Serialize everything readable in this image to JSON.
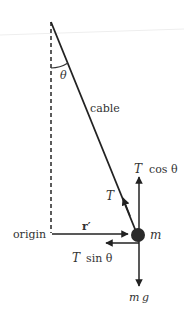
{
  "diagram": {
    "colors": {
      "line": "#222222",
      "text": "#333333",
      "mass": "#2a2a2a",
      "background": "#ffffff"
    },
    "labels": {
      "theta": "θ",
      "cable": "cable",
      "tension_vec": "T",
      "t_cos": "T",
      "cos_theta": "cos θ",
      "t_sin": "T",
      "sin_theta": "sin θ",
      "origin": "origin",
      "r_prime": "r′",
      "mass": "m",
      "weight_m": "m",
      "weight_g": "g"
    },
    "elements": [
      {
        "id": "pivot",
        "x": 51,
        "y": 22
      },
      {
        "id": "mass",
        "x": 137,
        "y": 234,
        "radius": 7
      },
      {
        "id": "vertical-reference",
        "style": "dashed",
        "from": [
          51,
          22
        ],
        "to": [
          51,
          233
        ]
      },
      {
        "id": "cable",
        "from": [
          51,
          22
        ],
        "to": [
          137,
          234
        ]
      },
      {
        "id": "r-prime-vector",
        "from": [
          52,
          234
        ],
        "to": [
          129,
          234
        ]
      },
      {
        "id": "t-cos-vector",
        "direction": "up"
      },
      {
        "id": "t-sin-vector",
        "direction": "left"
      },
      {
        "id": "weight-vector",
        "direction": "down"
      },
      {
        "id": "tension-vector",
        "direction": "along-cable-toward-pivot"
      }
    ]
  }
}
